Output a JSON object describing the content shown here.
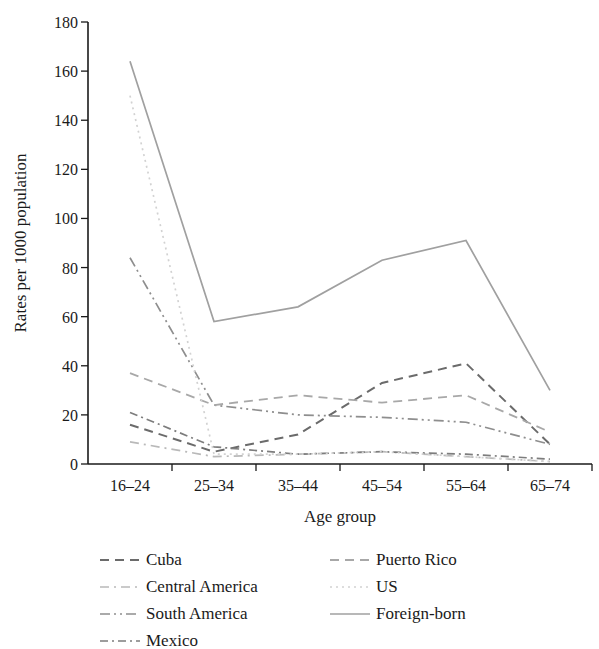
{
  "chart_data": {
    "type": "line",
    "title": "",
    "xlabel": "Age group",
    "ylabel": "Rates per 1000 population",
    "categories": [
      "16–24",
      "25–34",
      "35–44",
      "45–54",
      "55–64",
      "65–74"
    ],
    "ylim": [
      0,
      180
    ],
    "ytick_labels": [
      "0",
      "20",
      "40",
      "60",
      "80",
      "100",
      "120",
      "140",
      "160",
      "180"
    ],
    "ytick_values": [
      0,
      20,
      40,
      60,
      80,
      100,
      120,
      140,
      160,
      180
    ],
    "grid": false,
    "legend_position": "bottom",
    "series": [
      {
        "name": "Cuba",
        "values": [
          16,
          5,
          12,
          33,
          41,
          8
        ],
        "style": "dashed",
        "dash": "9,6",
        "color": "#6b6b6b",
        "width": 2.0
      },
      {
        "name": "Central America",
        "values": [
          9,
          3,
          4,
          5,
          3,
          1
        ],
        "style": "dash-dot",
        "dash": "9,5,2,5",
        "color": "#b9b9b9",
        "width": 1.7
      },
      {
        "name": "South America",
        "values": [
          84,
          24,
          20,
          19,
          17,
          8
        ],
        "style": "dash-dot-dot",
        "dash": "10,4,2,4,2,4",
        "color": "#8e8e8e",
        "width": 1.7
      },
      {
        "name": "Mexico",
        "values": [
          21,
          7,
          4,
          5,
          4,
          2
        ],
        "style": "dash-dot",
        "dash": "8,4,2,4",
        "color": "#7d7d7d",
        "width": 1.7
      },
      {
        "name": "Puerto Rico",
        "values": [
          37,
          24,
          28,
          25,
          28,
          13
        ],
        "style": "dashed",
        "dash": "9,6",
        "color": "#a8a8a8",
        "width": 1.8
      },
      {
        "name": "US",
        "values": [
          150,
          4,
          4,
          5,
          3,
          1
        ],
        "style": "dotted",
        "dash": "2,4",
        "color": "#d2d2d2",
        "width": 1.7
      },
      {
        "name": "Foreign-born",
        "values": [
          164,
          58,
          64,
          83,
          91,
          30
        ],
        "style": "solid",
        "dash": "none",
        "color": "#a0a0a0",
        "width": 1.7
      }
    ]
  },
  "legend": {
    "columns": [
      {
        "entries": [
          "Cuba",
          "Central America",
          "South America",
          "Mexico"
        ]
      },
      {
        "entries": [
          "Puerto Rico",
          "US",
          "Foreign-born"
        ]
      }
    ]
  },
  "axes": {
    "x_title": "Age group",
    "y_title": "Rates per 1000 population"
  }
}
